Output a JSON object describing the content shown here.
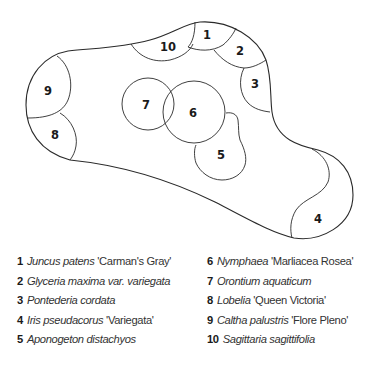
{
  "plan": {
    "title": "Pond planting plan",
    "zones": [
      {
        "number": "1"
      },
      {
        "number": "2"
      },
      {
        "number": "3"
      },
      {
        "number": "4"
      },
      {
        "number": "5"
      },
      {
        "number": "6"
      },
      {
        "number": "7"
      },
      {
        "number": "8"
      },
      {
        "number": "9"
      },
      {
        "number": "10"
      }
    ]
  },
  "legend": {
    "column1": [
      {
        "number": "1",
        "scientific": "Juncus patens",
        "cultivar": " 'Carman's Gray'"
      },
      {
        "number": "2",
        "scientific": "Glyceria maxima var. variegata",
        "cultivar": ""
      },
      {
        "number": "3",
        "scientific": "Pontederia cordata",
        "cultivar": ""
      },
      {
        "number": "4",
        "scientific": "Iris pseudacorus",
        "cultivar": " 'Variegata'"
      },
      {
        "number": "5",
        "scientific": "Aponogeton distachyos",
        "cultivar": ""
      }
    ],
    "column2": [
      {
        "number": "6",
        "scientific": "Nymphaea",
        "cultivar": " 'Marliacea Rosea'"
      },
      {
        "number": "7",
        "scientific": "Orontium aquaticum",
        "cultivar": ""
      },
      {
        "number": "8",
        "scientific": "Lobelia",
        "cultivar": " 'Queen Victoria'"
      },
      {
        "number": "9",
        "scientific": "Caltha palustris",
        "cultivar": " 'Flore Pleno'"
      },
      {
        "number": "10",
        "scientific": "Sagittaria sagittifolia",
        "cultivar": ""
      }
    ]
  }
}
